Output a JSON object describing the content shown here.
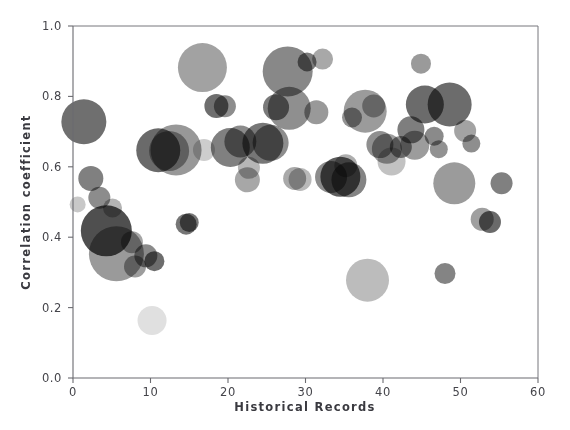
{
  "figure": {
    "background_color": "#ffffff",
    "axis_color": "#6b6b70",
    "text_color": "#44444a"
  },
  "chart_data": {
    "type": "scatter",
    "title": "",
    "subtitle": "",
    "xlabel": "Historical Records",
    "ylabel": "Correlation coefficient",
    "xlim": [
      0,
      60
    ],
    "ylim": [
      0.0,
      1.0
    ],
    "xticks": [
      0,
      10,
      20,
      30,
      40,
      50,
      60
    ],
    "xtick_labels": [
      "0",
      "10",
      "20",
      "30",
      "40",
      "50",
      "60"
    ],
    "yticks": [
      0.0,
      0.2,
      0.4,
      0.6,
      0.8,
      1.0
    ],
    "ytick_labels": [
      "0.0",
      "0.2",
      "0.4",
      "0.6",
      "0.8",
      "1.0"
    ],
    "grid": false,
    "legend": null,
    "marker": "circle",
    "marker_size_encodes": "bubble-area",
    "points": [
      {
        "x": 0.6,
        "y": 0.493,
        "r": 8.0,
        "color": "#c8c8c8"
      },
      {
        "x": 1.4,
        "y": 0.728,
        "r": 22.5,
        "color": "#6f6f6f"
      },
      {
        "x": 2.3,
        "y": 0.567,
        "r": 12.5,
        "color": "#808080"
      },
      {
        "x": 3.4,
        "y": 0.512,
        "r": 11.0,
        "color": "#8c8c8c"
      },
      {
        "x": 4.3,
        "y": 0.418,
        "r": 25.5,
        "color": "#4f4f4f"
      },
      {
        "x": 5.6,
        "y": 0.353,
        "r": 27.5,
        "color": "#9a9a9a"
      },
      {
        "x": 5.1,
        "y": 0.483,
        "r": 9.5,
        "color": "#b4b4b4"
      },
      {
        "x": 7.6,
        "y": 0.386,
        "r": 11.0,
        "color": "#a5a5a5"
      },
      {
        "x": 8.0,
        "y": 0.317,
        "r": 11.0,
        "color": "#9d9d9d"
      },
      {
        "x": 9.4,
        "y": 0.347,
        "r": 11.5,
        "color": "#8a8a8a"
      },
      {
        "x": 10.5,
        "y": 0.332,
        "r": 10.0,
        "color": "#6d6d6d"
      },
      {
        "x": 10.2,
        "y": 0.163,
        "r": 14.5,
        "color": "#e0e0e0"
      },
      {
        "x": 11.0,
        "y": 0.647,
        "r": 22.0,
        "color": "#6a6a6a"
      },
      {
        "x": 12.4,
        "y": 0.645,
        "r": 20.0,
        "color": "#a0a0a0"
      },
      {
        "x": 13.3,
        "y": 0.648,
        "r": 25.5,
        "color": "#989898"
      },
      {
        "x": 14.6,
        "y": 0.437,
        "r": 10.5,
        "color": "#767676"
      },
      {
        "x": 15.0,
        "y": 0.442,
        "r": 9.5,
        "color": "#777777"
      },
      {
        "x": 16.7,
        "y": 0.882,
        "r": 24.5,
        "color": "#a2a2a2"
      },
      {
        "x": 16.9,
        "y": 0.648,
        "r": 11.0,
        "color": "#cdcdcd"
      },
      {
        "x": 18.5,
        "y": 0.773,
        "r": 12.0,
        "color": "#6e6e6e"
      },
      {
        "x": 19.6,
        "y": 0.772,
        "r": 11.0,
        "color": "#8d8d8d"
      },
      {
        "x": 20.3,
        "y": 0.655,
        "r": 19.5,
        "color": "#808080"
      },
      {
        "x": 21.6,
        "y": 0.672,
        "r": 16.0,
        "color": "#8b8b8b"
      },
      {
        "x": 22.7,
        "y": 0.597,
        "r": 11.0,
        "color": "#b6b6b6"
      },
      {
        "x": 22.5,
        "y": 0.563,
        "r": 12.5,
        "color": "#a7a7a7"
      },
      {
        "x": 24.5,
        "y": 0.667,
        "r": 20.5,
        "color": "#777777"
      },
      {
        "x": 25.5,
        "y": 0.668,
        "r": 18.0,
        "color": "#8d8d8d"
      },
      {
        "x": 26.2,
        "y": 0.769,
        "r": 13.0,
        "color": "#7a7a7a"
      },
      {
        "x": 27.7,
        "y": 0.871,
        "r": 25.0,
        "color": "#888888"
      },
      {
        "x": 27.9,
        "y": 0.766,
        "r": 21.5,
        "color": "#8f8f8f"
      },
      {
        "x": 28.6,
        "y": 0.567,
        "r": 11.5,
        "color": "#a9a9a9"
      },
      {
        "x": 29.3,
        "y": 0.564,
        "r": 11.5,
        "color": "#b9b9b9"
      },
      {
        "x": 30.2,
        "y": 0.898,
        "r": 9.5,
        "color": "#7c7c7c"
      },
      {
        "x": 31.4,
        "y": 0.755,
        "r": 12.0,
        "color": "#999999"
      },
      {
        "x": 32.2,
        "y": 0.906,
        "r": 10.5,
        "color": "#a8a8a8"
      },
      {
        "x": 33.3,
        "y": 0.571,
        "r": 16.0,
        "color": "#8c8c8c"
      },
      {
        "x": 34.5,
        "y": 0.572,
        "r": 20.0,
        "color": "#5d5d5d"
      },
      {
        "x": 35.2,
        "y": 0.603,
        "r": 11.5,
        "color": "#aeaeae"
      },
      {
        "x": 35.6,
        "y": 0.563,
        "r": 17.5,
        "color": "#848484"
      },
      {
        "x": 36.0,
        "y": 0.74,
        "r": 10.0,
        "color": "#939393"
      },
      {
        "x": 37.7,
        "y": 0.758,
        "r": 21.5,
        "color": "#9b9b9b"
      },
      {
        "x": 38.0,
        "y": 0.278,
        "r": 21.5,
        "color": "#bcbcbc"
      },
      {
        "x": 38.8,
        "y": 0.773,
        "r": 11.5,
        "color": "#a6a6a6"
      },
      {
        "x": 39.6,
        "y": 0.663,
        "r": 13.5,
        "color": "#8f8f8f"
      },
      {
        "x": 40.5,
        "y": 0.651,
        "r": 15.0,
        "color": "#9e9e9e"
      },
      {
        "x": 41.1,
        "y": 0.615,
        "r": 14.0,
        "color": "#c2c2c2"
      },
      {
        "x": 42.3,
        "y": 0.656,
        "r": 11.0,
        "color": "#898989"
      },
      {
        "x": 43.6,
        "y": 0.705,
        "r": 13.5,
        "color": "#7e7e7e"
      },
      {
        "x": 44.1,
        "y": 0.661,
        "r": 14.5,
        "color": "#9c9c9c"
      },
      {
        "x": 44.9,
        "y": 0.893,
        "r": 10.0,
        "color": "#9a9a9a"
      },
      {
        "x": 45.4,
        "y": 0.777,
        "r": 19.0,
        "color": "#6b6b6b"
      },
      {
        "x": 46.6,
        "y": 0.687,
        "r": 9.5,
        "color": "#8a8a8a"
      },
      {
        "x": 47.2,
        "y": 0.65,
        "r": 9.0,
        "color": "#929292"
      },
      {
        "x": 48.0,
        "y": 0.297,
        "r": 10.5,
        "color": "#848484"
      },
      {
        "x": 48.6,
        "y": 0.777,
        "r": 22.0,
        "color": "#6c6c6c"
      },
      {
        "x": 49.2,
        "y": 0.553,
        "r": 21.0,
        "color": "#9b9b9b"
      },
      {
        "x": 50.6,
        "y": 0.702,
        "r": 11.0,
        "color": "#a3a3a3"
      },
      {
        "x": 51.4,
        "y": 0.666,
        "r": 9.0,
        "color": "#8e8e8e"
      },
      {
        "x": 52.8,
        "y": 0.451,
        "r": 11.5,
        "color": "#9f9f9f"
      },
      {
        "x": 53.8,
        "y": 0.443,
        "r": 11.0,
        "color": "#6a6a6a"
      },
      {
        "x": 55.3,
        "y": 0.553,
        "r": 11.0,
        "color": "#808080"
      }
    ]
  }
}
